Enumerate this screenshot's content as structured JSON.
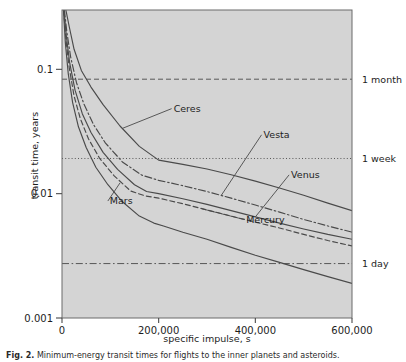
{
  "figure": {
    "caption_label": "Fig. 2.",
    "caption_text": " Minimum-energy transit times for flights to the inner planets and asteroids."
  },
  "chart_data": {
    "type": "line",
    "title": "",
    "xlabel": "specific impulse, s",
    "ylabel": "transit time, years",
    "xlim": [
      0,
      600000
    ],
    "ylim": [
      0.001,
      0.3
    ],
    "yscale": "log",
    "xscale": "linear",
    "grid": false,
    "legend_position": "inline-labels",
    "xticks": [
      0,
      200000,
      400000,
      600000
    ],
    "xtick_labels": [
      "0",
      "200,000",
      "400,000",
      "600,000"
    ],
    "yticks": [
      0.001,
      0.01,
      0.1
    ],
    "ytick_labels": [
      "0.001",
      "0.01",
      "0.1"
    ],
    "plot_bg_color": "#d4d4d4",
    "line_color": "#4a4a4a",
    "reference_lines": [
      {
        "label": "1 month",
        "value": 0.0833,
        "style": "dashed"
      },
      {
        "label": "1 week",
        "value": 0.01918,
        "style": "dotted"
      },
      {
        "label": "1 day",
        "value": 0.00274,
        "style": "dashdot"
      }
    ],
    "series": [
      {
        "name": "Ceres",
        "style": "solid",
        "x": [
          8000,
          15000,
          25000,
          40000,
          60000,
          85000,
          120000,
          160000,
          200000,
          250000,
          300000,
          350000,
          400000,
          450000,
          500000,
          550000,
          600000
        ],
        "y": [
          0.3,
          0.22,
          0.145,
          0.098,
          0.072,
          0.052,
          0.035,
          0.024,
          0.0186,
          0.0172,
          0.0158,
          0.0142,
          0.0126,
          0.0111,
          0.0097,
          0.0084,
          0.0073
        ]
      },
      {
        "name": "Vesta",
        "style": "dashdot",
        "x": [
          5000,
          10000,
          18000,
          30000,
          45000,
          65000,
          90000,
          125000,
          165000,
          200000,
          250000,
          300000,
          350000,
          400000,
          450000,
          500000,
          550000,
          600000
        ],
        "y": [
          0.3,
          0.2,
          0.125,
          0.078,
          0.053,
          0.036,
          0.0255,
          0.018,
          0.0141,
          0.0128,
          0.0116,
          0.0104,
          0.0092,
          0.0081,
          0.0071,
          0.0062,
          0.0055,
          0.0049
        ]
      },
      {
        "name": "Venus",
        "style": "solid",
        "x": [
          4000,
          9000,
          16000,
          27000,
          42000,
          60000,
          85000,
          115000,
          150000,
          175000,
          200000,
          250000,
          300000,
          350000,
          400000,
          450000,
          500000,
          550000,
          600000
        ],
        "y": [
          0.3,
          0.185,
          0.112,
          0.068,
          0.044,
          0.031,
          0.0215,
          0.0157,
          0.0118,
          0.0104,
          0.01,
          0.0091,
          0.0082,
          0.0073,
          0.0065,
          0.0058,
          0.0052,
          0.0047,
          0.0043
        ]
      },
      {
        "name": "Mercury",
        "style": "dashed",
        "x": [
          3500,
          8000,
          15000,
          25000,
          38000,
          55000,
          78000,
          108000,
          142000,
          172000,
          200000,
          250000,
          300000,
          350000,
          400000,
          450000,
          500000,
          550000,
          600000
        ],
        "y": [
          0.3,
          0.175,
          0.103,
          0.061,
          0.04,
          0.0275,
          0.0192,
          0.0139,
          0.0105,
          0.0096,
          0.0092,
          0.0083,
          0.0074,
          0.0066,
          0.0059,
          0.0053,
          0.0047,
          0.0042,
          0.0038
        ]
      },
      {
        "name": "Mars",
        "style": "solid",
        "x": [
          3000,
          7000,
          13000,
          22000,
          34000,
          50000,
          70000,
          95000,
          125000,
          160000,
          190000,
          210000,
          250000,
          300000,
          350000,
          400000,
          450000,
          500000,
          550000,
          600000
        ],
        "y": [
          0.3,
          0.162,
          0.092,
          0.054,
          0.0345,
          0.0235,
          0.0163,
          0.0118,
          0.0086,
          0.0066,
          0.0058,
          0.0055,
          0.0049,
          0.0043,
          0.0037,
          0.0032,
          0.0028,
          0.00245,
          0.00215,
          0.0019
        ]
      }
    ],
    "annotations": [
      {
        "text": "Ceres",
        "x": 0.385,
        "y": 0.33,
        "anchor": "start"
      },
      {
        "text": "Vesta",
        "x": 0.695,
        "y": 0.415,
        "anchor": "start"
      },
      {
        "text": "Venus",
        "x": 0.79,
        "y": 0.545,
        "anchor": "start"
      },
      {
        "text": "Mercury",
        "x": 0.635,
        "y": 0.69,
        "anchor": "start"
      },
      {
        "text": "Mars",
        "x": 0.165,
        "y": 0.63,
        "anchor": "start"
      }
    ]
  }
}
